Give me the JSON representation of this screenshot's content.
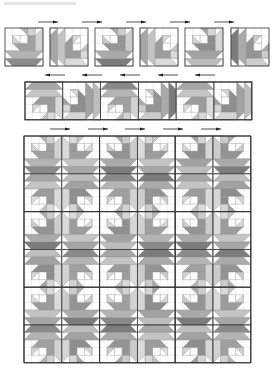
{
  "diagram": {
    "caption_visible_text": "",
    "canvas": {
      "width": 279,
      "height": 383
    },
    "colors": {
      "background": "#ffffff",
      "outline": "#333333",
      "seam": "#9a9a9a",
      "arrow": "#222222",
      "white": "#ffffff",
      "light": "#cfcfcf",
      "mid": "#b0b0b0",
      "mid_dark": "#9a9a9a",
      "dark": "#858585"
    },
    "block_shapes": [
      {
        "pts": [
          [
            0,
            4
          ],
          [
            5,
            4
          ],
          [
            5,
            5
          ],
          [
            0,
            5
          ]
        ],
        "fill": "dark"
      },
      {
        "pts": [
          [
            0,
            4
          ],
          [
            1,
            5
          ],
          [
            0,
            5
          ]
        ],
        "fill": "white"
      },
      {
        "pts": [
          [
            5,
            4
          ],
          [
            5,
            5
          ],
          [
            4,
            5
          ]
        ],
        "fill": "white"
      },
      {
        "pts": [
          [
            0,
            3
          ],
          [
            5,
            3
          ],
          [
            4,
            4
          ],
          [
            1,
            4
          ]
        ],
        "fill": "mid"
      },
      {
        "pts": [
          [
            1,
            2
          ],
          [
            4,
            2
          ],
          [
            4,
            3
          ],
          [
            2,
            3
          ]
        ],
        "fill": "mid_dark"
      },
      {
        "pts": [
          [
            1,
            1
          ],
          [
            2,
            1
          ],
          [
            2,
            2
          ],
          [
            1,
            2
          ]
        ],
        "fill": "white"
      },
      {
        "pts": [
          [
            1,
            1
          ],
          [
            2,
            2
          ],
          [
            1,
            2
          ]
        ],
        "fill": "light"
      },
      {
        "pts": [
          [
            2,
            1
          ],
          [
            3,
            1
          ],
          [
            3,
            2
          ],
          [
            2,
            2
          ]
        ],
        "fill": "white"
      },
      {
        "pts": [
          [
            2,
            0
          ],
          [
            3,
            0
          ],
          [
            3,
            1
          ]
        ],
        "fill": "mid"
      },
      {
        "pts": [
          [
            3,
            0
          ],
          [
            4,
            0
          ],
          [
            4,
            1
          ],
          [
            3,
            1
          ]
        ],
        "fill": "light"
      },
      {
        "pts": [
          [
            3,
            1
          ],
          [
            4,
            1
          ],
          [
            4,
            2
          ],
          [
            3,
            2
          ]
        ],
        "fill": "mid_dark"
      },
      {
        "pts": [
          [
            4,
            0
          ],
          [
            5,
            0
          ],
          [
            5,
            3
          ],
          [
            4,
            3
          ]
        ],
        "fill": "light"
      },
      {
        "pts": [
          [
            4,
            0
          ],
          [
            5,
            0
          ],
          [
            4,
            1
          ]
        ],
        "fill": "white"
      }
    ],
    "top_row": {
      "label": "Row of individual blocks",
      "y": 28,
      "size": 38,
      "blocks": [
        {
          "x": 5,
          "rot": 0,
          "shade": 0
        },
        {
          "x": 50,
          "rot": 90,
          "shade": 1
        },
        {
          "x": 95,
          "rot": 0,
          "shade": 2
        },
        {
          "x": 140,
          "rot": 90,
          "shade": 1
        },
        {
          "x": 185,
          "rot": 0,
          "shade": 3
        },
        {
          "x": 231,
          "rot": 90,
          "shade": 2
        }
      ],
      "arrows_above": {
        "y": 22,
        "direction": "right",
        "xs": [
          48,
          92,
          136,
          180,
          224
        ]
      },
      "arrows_below": {
        "y": 75,
        "direction": "left",
        "xs": [
          55,
          92,
          130,
          168,
          205
        ]
      }
    },
    "strip_row": {
      "label": "Joined row strip",
      "x": 25,
      "y": 82,
      "size": 37.8,
      "blocks": [
        {
          "rot": 180,
          "shade": 1,
          "flipx": true
        },
        {
          "rot": 270,
          "shade": 3,
          "flipx": true
        },
        {
          "rot": 180,
          "shade": 0,
          "flipx": true
        },
        {
          "rot": 270,
          "shade": 2,
          "flipx": true
        },
        {
          "rot": 180,
          "shade": 1,
          "flipx": true
        },
        {
          "rot": 270,
          "shade": 3,
          "flipx": true
        }
      ],
      "arrows_below": {
        "y": 129,
        "direction": "right",
        "xs": [
          60,
          98,
          135,
          173,
          211
        ]
      }
    },
    "quilt_grid": {
      "label": "Assembled quilt top",
      "x": 24,
      "y": 136,
      "cols": 6,
      "rows": 6,
      "size": 37.8,
      "unit_pattern": [
        [
          {
            "rot": 0,
            "flipx": false
          },
          {
            "rot": 0,
            "flipx": true
          }
        ],
        [
          {
            "rot": 180,
            "flipx": true
          },
          {
            "rot": 180,
            "flipx": false
          }
        ]
      ],
      "shades": [
        [
          0,
          1,
          2,
          1,
          3,
          2
        ],
        [
          1,
          3,
          0,
          2,
          1,
          3
        ],
        [
          2,
          1,
          3,
          0,
          2,
          1
        ],
        [
          3,
          0,
          1,
          2,
          0,
          2
        ],
        [
          1,
          2,
          0,
          3,
          2,
          1
        ],
        [
          0,
          3,
          2,
          1,
          3,
          0
        ]
      ]
    },
    "shade_sets": [
      {
        "dark": "#8a8a8a",
        "mid": "#b4b4b4",
        "mid_dark": "#a0a0a0",
        "light": "#d2d2d2"
      },
      {
        "dark": "#a6a6a6",
        "mid": "#c4c4c4",
        "mid_dark": "#9c9c9c",
        "light": "#dadada"
      },
      {
        "dark": "#7c7c7c",
        "mid": "#aaaaaa",
        "mid_dark": "#949494",
        "light": "#cccccc"
      },
      {
        "dark": "#bdbdbd",
        "mid": "#a2a2a2",
        "mid_dark": "#8e8e8e",
        "light": "#d6d6d6"
      }
    ]
  }
}
